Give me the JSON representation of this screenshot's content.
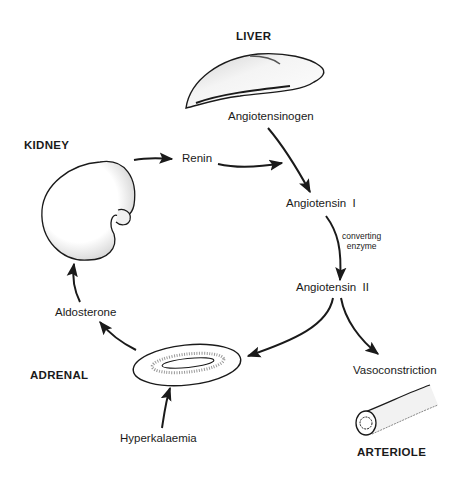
{
  "organs": {
    "liver": "LIVER",
    "kidney": "KIDNEY",
    "adrenal": "ADRENAL",
    "arteriole": "ARTERIOLE"
  },
  "substances": {
    "angiotensinogen": "Angiotensinogen",
    "renin": "Renin",
    "angiotensin_1": "Angiotensin  I",
    "angiotensin_2": "Angiotensin  II",
    "aldosterone": "Aldosterone",
    "hyperkalaemia": "Hyperkalaemia",
    "vasoconstriction": "Vasoconstriction"
  },
  "annotations": {
    "converting_enzyme_line1": "converting",
    "converting_enzyme_line2": "enzyme"
  },
  "flows": [
    {
      "from": "KIDNEY",
      "to": "Renin"
    },
    {
      "from": "Renin",
      "to": "Angiotensin I"
    },
    {
      "from": "Angiotensinogen",
      "to": "Angiotensin I"
    },
    {
      "from": "Angiotensin I",
      "to": "Angiotensin II",
      "label": "converting enzyme"
    },
    {
      "from": "Angiotensin II",
      "to": "ADRENAL"
    },
    {
      "from": "Angiotensin II",
      "to": "Vasoconstriction"
    },
    {
      "from": "Hyperkalaemia",
      "to": "ADRENAL"
    },
    {
      "from": "ADRENAL",
      "to": "Aldosterone"
    },
    {
      "from": "Aldosterone",
      "to": "KIDNEY"
    }
  ]
}
